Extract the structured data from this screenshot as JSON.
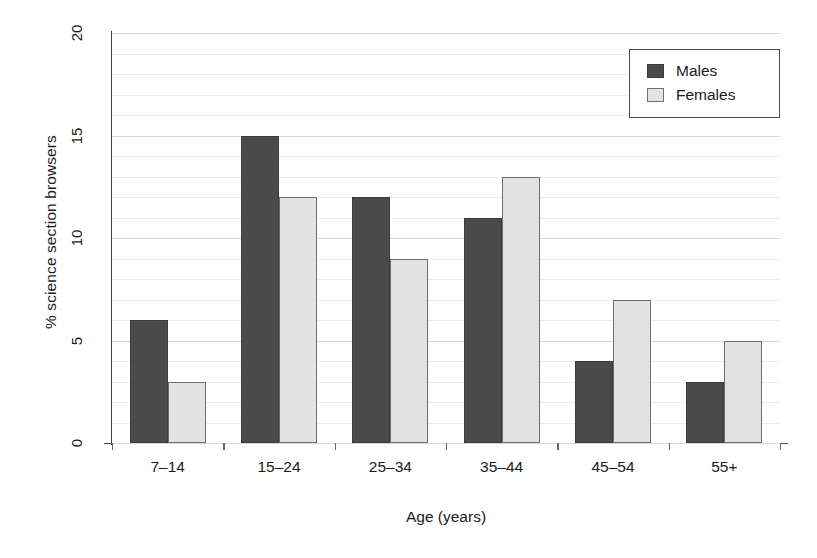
{
  "chart_data": {
    "type": "bar",
    "title": "",
    "xlabel": "Age (years)",
    "ylabel": "% science section browsers",
    "categories": [
      "7–14",
      "15–24",
      "25–34",
      "35–44",
      "45–54",
      "55+"
    ],
    "series": [
      {
        "name": "Males",
        "values": [
          6,
          15,
          12,
          11,
          4,
          3
        ],
        "color": "#4a4a4a"
      },
      {
        "name": "Females",
        "values": [
          3,
          12,
          9,
          13,
          7,
          5
        ],
        "color": "#e2e2e2"
      }
    ],
    "ylim": [
      0,
      20
    ],
    "y_ticks": [
      0,
      5,
      10,
      15,
      20
    ],
    "y_tick_labels": [
      "0",
      "5",
      "10",
      "15",
      "20"
    ],
    "y_minor_tick_step": 1,
    "grid": true,
    "grid_axis": "y",
    "legend_position": "top-right",
    "legend_entries": [
      "Males",
      "Females"
    ]
  },
  "legend": {
    "entries": [
      {
        "label": "Males",
        "swatch": "males-swatch"
      },
      {
        "label": "Females",
        "swatch": "females-swatch"
      }
    ]
  },
  "axes": {
    "y_title": "% science section browsers",
    "x_title": "Age (years)",
    "y_tick_labels": [
      "0",
      "5",
      "10",
      "15",
      "20"
    ],
    "x_tick_labels": [
      "7–14",
      "15–24",
      "25–34",
      "35–44",
      "45–54",
      "55+"
    ]
  },
  "colors": {
    "males": "#4a4a4a",
    "females": "#e2e2e2",
    "axis": "#3b3b3b",
    "grid_major": "#d8d8d8",
    "grid_minor": "#ededed",
    "background": "#ffffff"
  }
}
